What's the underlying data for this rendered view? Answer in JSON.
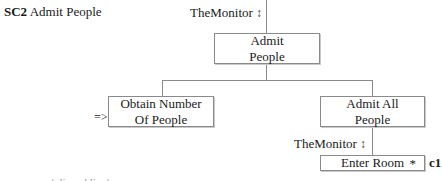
{
  "diagram": {
    "title": {
      "id": "SC2",
      "name": "Admit People"
    },
    "nodes": {
      "root": {
        "label_line1": "Admit",
        "label_line2": "People"
      },
      "obtain": {
        "label_line1": "Obtain Number",
        "label_line2": "Of People",
        "input_marker": "=>"
      },
      "admit_all": {
        "label_line1": "Admit All",
        "label_line2": "People"
      },
      "enter_room": {
        "label": "Enter Room",
        "iteration_marker": "*",
        "condition": "c1"
      }
    },
    "annotations": {
      "top_monitor": {
        "text": "TheMonitor",
        "glyph": "↕"
      },
      "lower_monitor": {
        "text": "TheMonitor",
        "glyph": "↕"
      }
    },
    "cutoff_text": "... (clipped line)"
  }
}
